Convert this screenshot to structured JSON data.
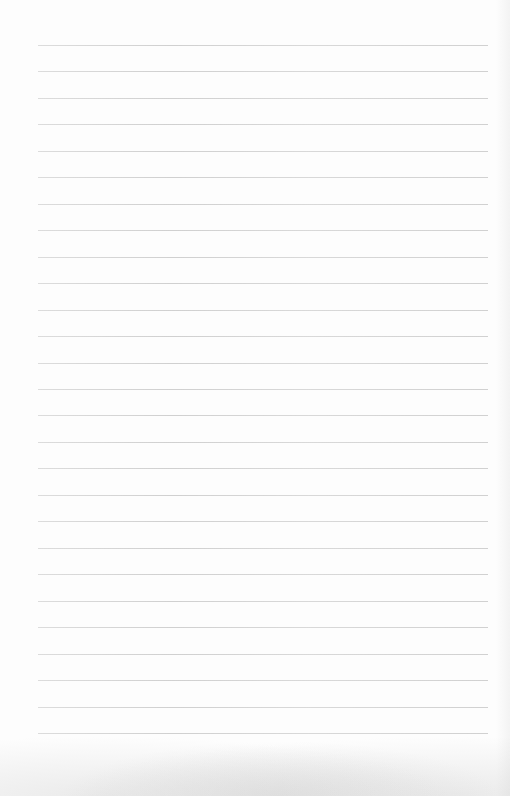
{
  "page": {
    "type": "ruled-paper",
    "background_color": "#fdfdfd",
    "line_color": "#cfcfcf",
    "line_count": 27,
    "first_line_y": 45,
    "line_spacing": 26.46,
    "line_left": 38,
    "line_right": 488,
    "content": []
  }
}
